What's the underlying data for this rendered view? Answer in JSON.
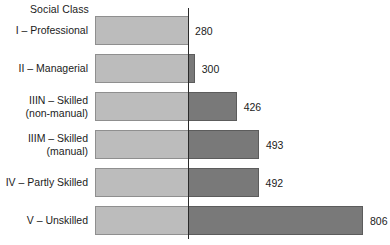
{
  "chart_data": {
    "type": "bar",
    "orientation": "horizontal",
    "title": "Social Class",
    "xlabel": "",
    "ylabel": "",
    "grid": false,
    "legend": null,
    "categories": [
      "I – Professional",
      "II – Managerial",
      "IIIN – Skilled\n(non-manual)",
      "IIIM – Skilled\n(manual)",
      "IV – Partly Skilled",
      "V – Unskilled"
    ],
    "values": [
      280,
      300,
      426,
      493,
      492,
      806
    ],
    "value_labels": [
      "280",
      "300",
      "426",
      "493",
      "492",
      "806"
    ],
    "xlim": [
      0,
      806
    ],
    "reference_line_value": 280,
    "colors": {
      "bar_below_reference": "#bcbcbc",
      "bar_above_reference": "#797979",
      "bar_below_border": "#8f8f8f",
      "bar_above_border": "#5c5c5c",
      "reference_line": "#2a2a2a",
      "text": "#1b1b1b",
      "background": "#ffffff"
    }
  },
  "layout": {
    "bar_origin_x": 95,
    "reference_line_x": 188,
    "px_per_unit": 0.3325,
    "first_row_top": 16,
    "bar_height": 29,
    "row_pitch": 38
  }
}
